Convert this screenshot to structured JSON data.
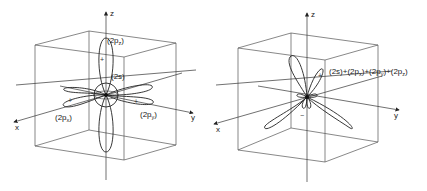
{
  "figure": {
    "left_panel": {
      "axes": {
        "x": "x",
        "y": "y",
        "z": "z"
      },
      "orbital_labels": {
        "pz": {
          "prefix": "(2p",
          "sub": "z",
          "suffix": ")"
        },
        "s": "(2s)",
        "px": {
          "prefix": "(2p",
          "sub": "x",
          "suffix": ")"
        },
        "py": {
          "prefix": "(2p",
          "sub": "y",
          "suffix": ")"
        }
      },
      "signs": {
        "pz_top": "+",
        "px_front": "+",
        "py_right": "+"
      }
    },
    "right_panel": {
      "axes": {
        "x": "x",
        "y": "y",
        "z": "z"
      },
      "hybrid_label": {
        "s": "(2s)+(2p",
        "sub_x": "x",
        "mid1": ")+(2p",
        "sub_y": "y",
        "mid2": ")+(2p",
        "sub_z": "z",
        "end": ")"
      },
      "signs": {
        "major_lobe": "+",
        "minor_lobe": "−"
      }
    }
  }
}
